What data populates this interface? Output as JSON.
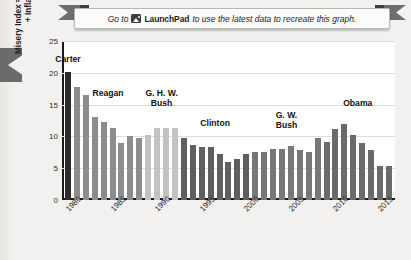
{
  "banner": {
    "prefix": "Go to",
    "icon": "launchpad-image-icon",
    "brand": "LaunchPad",
    "suffix": "to use the latest data to recreate this graph."
  },
  "chart_data": {
    "type": "bar",
    "title": "",
    "xlabel": "",
    "ylabel": "Misery Index = Unemployment Rate + Inflation Rate (%)",
    "ylim": [
      0,
      25
    ],
    "yticks": [
      0,
      5,
      10,
      15,
      20,
      25
    ],
    "xticks": [
      "1980",
      "1985",
      "1990",
      "1995",
      "2000",
      "2005",
      "2010",
      "2015"
    ],
    "grid": true,
    "legend": "none",
    "x": [
      1980,
      1981,
      1982,
      1983,
      1984,
      1985,
      1986,
      1987,
      1988,
      1989,
      1990,
      1991,
      1992,
      1993,
      1994,
      1995,
      1996,
      1997,
      1998,
      1999,
      2000,
      2001,
      2002,
      2003,
      2004,
      2005,
      2006,
      2007,
      2008,
      2009,
      2010,
      2011,
      2012,
      2013,
      2014,
      2015,
      2016
    ],
    "values": [
      20.2,
      17.8,
      16.5,
      13.0,
      12.2,
      11.3,
      9.0,
      10.0,
      9.8,
      10.2,
      11.4,
      11.4,
      11.3,
      9.8,
      8.7,
      8.4,
      8.4,
      7.3,
      6.0,
      6.4,
      7.3,
      7.6,
      7.5,
      8.0,
      8.0,
      8.5,
      7.8,
      7.5,
      9.8,
      9.2,
      11.2,
      12.0,
      10.2,
      9.0,
      7.8,
      5.4,
      5.4
    ],
    "eras": [
      {
        "name": "Carter",
        "label": "Carter",
        "start": 1980,
        "end": 1980,
        "color": "#2b2b2b"
      },
      {
        "name": "Reagan",
        "label": "Reagan",
        "start": 1981,
        "end": 1988,
        "color": "#8c8c8c"
      },
      {
        "name": "GHW Bush",
        "label": "G. H. W.\nBush",
        "start": 1989,
        "end": 1992,
        "color": "#c2c2c2"
      },
      {
        "name": "Clinton",
        "label": "Clinton",
        "start": 1993,
        "end": 2000,
        "color": "#5f5f5f"
      },
      {
        "name": "GW Bush",
        "label": "G. W.\nBush",
        "start": 2001,
        "end": 2008,
        "color": "#777777"
      },
      {
        "name": "Obama",
        "label": "Obama",
        "start": 2009,
        "end": 2016,
        "color": "#6a6a6a"
      }
    ]
  },
  "colors": {
    "axis": "#1a1a1a",
    "plot_background": "#ffffff",
    "page_background": "#f1f0ee",
    "gridline": "#dedede"
  }
}
